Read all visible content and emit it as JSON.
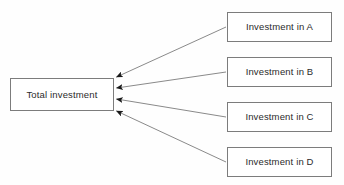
{
  "diagram": {
    "type": "convergent-arrow-diagram",
    "background_color": "#fefefe",
    "node_border_color": "#7c7c7c",
    "node_fill_color": "#ffffff",
    "edge_color": "#8a8a8a",
    "arrowhead_color": "#1a1a1a",
    "text_color": "#2b2b2b",
    "target": {
      "id": "total-investment",
      "label": "Total investment"
    },
    "sources": [
      {
        "id": "investment-a",
        "label": "Investment in A"
      },
      {
        "id": "investment-b",
        "label": "Investment in B"
      },
      {
        "id": "investment-c",
        "label": "Investment in C"
      },
      {
        "id": "investment-d",
        "label": "Investment in D"
      }
    ],
    "edges": [
      {
        "from": "investment-a",
        "to": "total-investment"
      },
      {
        "from": "investment-b",
        "to": "total-investment"
      },
      {
        "from": "investment-c",
        "to": "total-investment"
      },
      {
        "from": "investment-d",
        "to": "total-investment"
      }
    ]
  }
}
